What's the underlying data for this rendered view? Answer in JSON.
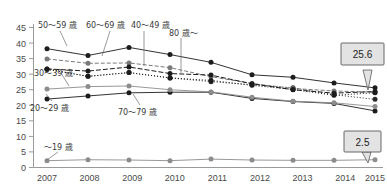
{
  "chart_data": {
    "type": "line",
    "title": "",
    "subtitle": "",
    "xlabel": "",
    "ylabel": "",
    "x": [
      "2007",
      "2008",
      "2009",
      "2010",
      "2011",
      "2012",
      "2013",
      "2014",
      "2015"
    ],
    "categories": [
      "2007",
      "2008",
      "2009",
      "2010",
      "2011",
      "2012",
      "2013",
      "2014",
      "2015"
    ],
    "ylim": [
      0,
      45
    ],
    "yticks": [
      "0",
      "5",
      "10",
      "15",
      "20",
      "25",
      "30",
      "35",
      "40",
      "45"
    ],
    "ytick_values": [
      0,
      5,
      10,
      15,
      20,
      25,
      30,
      35,
      40,
      45
    ],
    "grid": false,
    "legend": "inline-annotations",
    "series": [
      {
        "name": "〜19 歳",
        "key": "u19",
        "values": [
          2.2,
          2.5,
          2.4,
          2.2,
          2.7,
          2.4,
          2.3,
          2.3,
          2.5
        ],
        "color": "#8c8c8c",
        "dash": "none",
        "marker": "circle"
      },
      {
        "name": "20～29 歳",
        "key": "a20",
        "values": [
          22.0,
          23.0,
          24.0,
          24.2,
          24.2,
          22.2,
          21.2,
          20.6,
          18.2
        ],
        "color": "#1c1c1c",
        "dash": "none",
        "marker": "circle"
      },
      {
        "name": "30～39 歳",
        "key": "a30",
        "values": [
          25.2,
          26.0,
          26.2,
          25.0,
          24.3,
          22.6,
          21.3,
          20.8,
          19.6
        ],
        "color": "#8c8c8c",
        "dash": "none",
        "marker": "circle"
      },
      {
        "name": "40～49 歳",
        "key": "a40",
        "values": [
          31.6,
          29.3,
          30.5,
          28.8,
          27.6,
          26.6,
          25.6,
          23.4,
          21.9
        ],
        "color": "#2a2a2a",
        "dash": "1,2",
        "marker": "circle"
      },
      {
        "name": "50～59 歳",
        "key": "a50",
        "values": [
          38.2,
          36.0,
          38.6,
          36.3,
          33.8,
          29.8,
          29.0,
          27.2,
          25.6
        ],
        "color": "#1c1c1c",
        "dash": "none",
        "marker": "circle"
      },
      {
        "name": "60～69 歳",
        "key": "a60",
        "values": [
          34.9,
          33.5,
          33.6,
          32.1,
          29.2,
          27.0,
          25.4,
          24.6,
          24.2
        ],
        "color": "#7a7a7a",
        "dash": "4,2",
        "marker": "circle"
      },
      {
        "name": "70～79 歳",
        "key": "a70",
        "values": [
          31.7,
          31.0,
          32.3,
          30.2,
          29.7,
          26.9,
          25.0,
          23.9,
          24.4
        ],
        "color": "#1c1c1c",
        "dash": "5,2",
        "marker": "circle"
      },
      {
        "name": "80 歳～",
        "key": "a80",
        "values": [
          31.6,
          29.3,
          30.5,
          28.8,
          28.0,
          26.4,
          25.1,
          23.2,
          24.0
        ],
        "color": "#1c1c1c",
        "dash": "1,2",
        "marker": "circle"
      }
    ],
    "annotations": [
      {
        "name": "callout-top",
        "text": "25.6",
        "series": "50～59 歳",
        "x": "2015",
        "value": 25.6
      },
      {
        "name": "callout-bottom",
        "text": "2.5",
        "series": "〜19 歳",
        "x": "2015",
        "value": 2.5
      }
    ]
  },
  "labels": {
    "y_45": "45",
    "y_40": "40",
    "y_35": "35",
    "y_30": "30",
    "y_25": "25",
    "y_20": "20",
    "y_15": "15",
    "y_10": "10",
    "y_5": "5",
    "y_0": "0",
    "x_2007": "2007",
    "x_2008": "2008",
    "x_2009": "2009",
    "x_2010": "2010",
    "x_2011": "2011",
    "x_2012": "2012",
    "x_2013": "2013",
    "x_2014": "2014",
    "x_2015": "2015",
    "series_50_59": "50～59 歳",
    "series_60_69": "60～69 歳",
    "series_40_49": "40～49 歳",
    "series_80_up": "80 歳～",
    "series_30_39": "30～39 歳",
    "series_20_29": "20～29 歳",
    "series_70_79": "70～79 歳",
    "series_u19": "〜19 歳",
    "callout_top": "25.6",
    "callout_bottom": "2.5"
  },
  "colors": {
    "axis": "#9a9a9a",
    "tick_text": "#4a4a4a",
    "callout_fill": "#e3e3e3",
    "callout_stroke": "#5a5a5a",
    "dark_series": "#1c1c1c",
    "grey_series": "#8c8c8c"
  }
}
